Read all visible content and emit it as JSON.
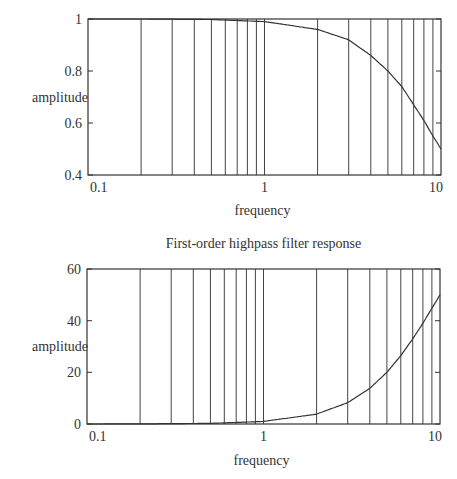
{
  "chart_data": [
    {
      "type": "line",
      "title": "First-order lowpass filter response",
      "xlabel": "frequency",
      "ylabel": "amplitude",
      "xscale": "log",
      "xlim": [
        0.1,
        10
      ],
      "ylim": [
        0.4,
        1
      ],
      "xticks": [
        0.1,
        1,
        10
      ],
      "xtick_labels": [
        "0.1",
        "1",
        "10"
      ],
      "yticks": [
        0.4,
        0.6,
        0.8,
        1
      ],
      "ytick_labels": [
        "0.4",
        "0.6",
        "0.8",
        "1"
      ],
      "grid": "vertical log minor+major",
      "vertical_gridlines": [
        0.2,
        0.3,
        0.4,
        0.5,
        0.6,
        0.7,
        0.8,
        0.9,
        1,
        2,
        3,
        4,
        5,
        6,
        7,
        8,
        9
      ],
      "series": [
        {
          "name": "lowpass",
          "formula": "1/(1+(f/10)^2)",
          "x": [
            0.1,
            0.2,
            0.5,
            1,
            2,
            3,
            4,
            5,
            6,
            7,
            8,
            9,
            10
          ],
          "y": [
            1.0,
            1.0,
            0.998,
            0.99,
            0.96,
            0.92,
            0.86,
            0.8,
            0.74,
            0.67,
            0.61,
            0.55,
            0.5
          ]
        }
      ],
      "frame": {
        "left": 88,
        "right": 441,
        "top": 19,
        "bottom": 175
      },
      "title_y": -4,
      "xtick_label_y": 192,
      "xlabel_y": 215,
      "ylabel_x": 60,
      "ylabel_y": 102
    },
    {
      "type": "line",
      "title": "First-order highpass filter response",
      "xlabel": "frequency",
      "ylabel": "amplitude",
      "xscale": "log",
      "xlim": [
        0.1,
        10
      ],
      "ylim": [
        0,
        60
      ],
      "xticks": [
        0.1,
        1,
        10
      ],
      "xtick_labels": [
        "0.1",
        "1",
        "10"
      ],
      "yticks": [
        0,
        20,
        40,
        60
      ],
      "ytick_labels": [
        "0",
        "20",
        "40",
        "60"
      ],
      "grid": "vertical log minor+major",
      "vertical_gridlines": [
        0.2,
        0.3,
        0.4,
        0.5,
        0.6,
        0.7,
        0.8,
        0.9,
        1,
        2,
        3,
        4,
        5,
        6,
        7,
        8,
        9
      ],
      "series": [
        {
          "name": "highpass",
          "formula": "f^2/(1+(f/10)^2)",
          "x": [
            0.1,
            0.2,
            0.5,
            1,
            2,
            3,
            4,
            5,
            6,
            7,
            8,
            9,
            10
          ],
          "y": [
            0.01,
            0.04,
            0.25,
            0.99,
            3.85,
            8.26,
            13.8,
            20.0,
            26.5,
            32.9,
            39.0,
            44.8,
            50.0
          ]
        }
      ],
      "frame": {
        "left": 87,
        "right": 440,
        "top": 269,
        "bottom": 424
      },
      "title_y": 248,
      "xtick_label_y": 441,
      "xlabel_y": 465,
      "ylabel_x": 60,
      "ylabel_y": 351
    }
  ],
  "colors": {
    "line": "#333333",
    "grid": "#444444",
    "background": "#ffffff"
  }
}
